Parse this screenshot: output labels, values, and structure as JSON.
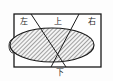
{
  "figure": {
    "name": "direction-regions-diagram",
    "colors": {
      "stroke": "#1a1a1a",
      "hatch": "#3a3a3a",
      "fill": "#f2f2f2",
      "background": "#fdfdfd"
    },
    "labels": {
      "left": "左",
      "top": "上",
      "right": "右",
      "bottom": "下"
    },
    "geometry": {
      "rect": {
        "x": 14,
        "y": 14,
        "width": 87,
        "height": 53
      },
      "ellipse": {
        "cx": 52,
        "cy": 45,
        "rx": 42,
        "ry": 17
      },
      "diagonals": [
        {
          "x1": 31,
          "y1": 14,
          "x2": 66,
          "y2": 67
        },
        {
          "x1": 79,
          "y1": 14,
          "x2": 51,
          "y2": 67
        }
      ],
      "left_tick": {
        "cx": 13,
        "cy": 46,
        "rx": 3,
        "ry": 7
      }
    }
  }
}
